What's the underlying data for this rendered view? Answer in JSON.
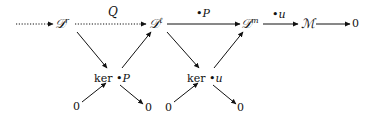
{
  "diagram": {
    "type": "commutative-diagram",
    "nodes": {
      "Dr": {
        "base": "𝒟",
        "sup": "r"
      },
      "Dl": {
        "base": "𝒟",
        "sup": "ℓ"
      },
      "Dm": {
        "base": "𝒟",
        "sup": "m"
      },
      "M": {
        "text": "ℳ"
      },
      "zero_right": {
        "text": "0"
      },
      "kerP": {
        "ker": "ker",
        "op": "•P"
      },
      "keru": {
        "ker": "ker",
        "op": "•u"
      },
      "zero_bl1": {
        "text": "0"
      },
      "zero_br1": {
        "text": "0"
      },
      "zero_bl2": {
        "text": "0"
      },
      "zero_br2": {
        "text": "0"
      }
    },
    "edge_labels": {
      "Q": "Q",
      "P": "•P",
      "u": "•u"
    },
    "edges": [
      {
        "from": "left",
        "to": "Dr",
        "style": "dotted"
      },
      {
        "from": "Dr",
        "to": "Dl",
        "style": "dotted",
        "label": "Q"
      },
      {
        "from": "Dl",
        "to": "Dm",
        "style": "solid",
        "label": "•P"
      },
      {
        "from": "Dm",
        "to": "M",
        "style": "solid",
        "label": "•u"
      },
      {
        "from": "M",
        "to": "zero_right",
        "style": "solid"
      },
      {
        "from": "Dr",
        "to": "kerP",
        "style": "solid"
      },
      {
        "from": "kerP",
        "to": "Dl",
        "style": "solid"
      },
      {
        "from": "zero_bl1",
        "to": "kerP",
        "style": "solid"
      },
      {
        "from": "kerP",
        "to": "zero_br1",
        "style": "solid"
      },
      {
        "from": "Dl",
        "to": "keru",
        "style": "solid"
      },
      {
        "from": "keru",
        "to": "Dm",
        "style": "solid"
      },
      {
        "from": "zero_bl2",
        "to": "keru",
        "style": "solid"
      },
      {
        "from": "keru",
        "to": "zero_br2",
        "style": "solid"
      }
    ],
    "colors": {
      "ink": "#111111",
      "background": "#ffffff"
    }
  }
}
